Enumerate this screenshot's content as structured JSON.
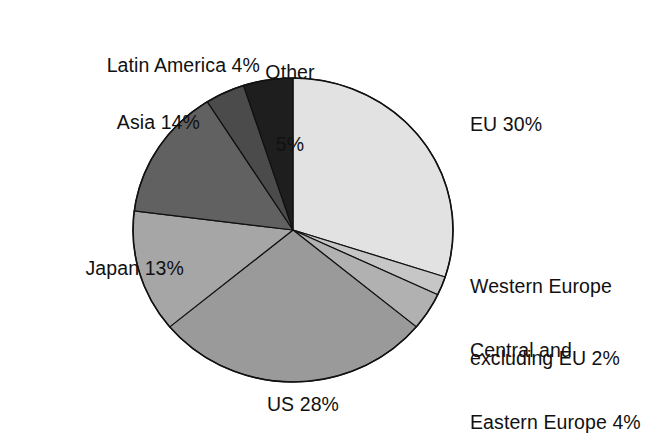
{
  "chart_data": {
    "type": "pie",
    "title": "",
    "subtitle": "",
    "xlabel": "",
    "ylabel": "",
    "legend_position": "none",
    "grid": false,
    "units": "percent",
    "start_angle_deg": 0,
    "direction": "clockwise",
    "categories": [
      "EU",
      "Western Europe excluding EU",
      "Central and Eastern Europe",
      "US",
      "Japan",
      "Asia",
      "Latin America",
      "Other"
    ],
    "values": [
      30,
      2,
      4,
      28,
      13,
      14,
      4,
      5
    ],
    "total": 100,
    "slices": [
      {
        "name": "EU",
        "value": 30,
        "label": "EU 30%",
        "color": "#e2e2e2",
        "start_deg": 0,
        "end_deg": 108
      },
      {
        "name": "Western Europe excluding EU",
        "value": 2,
        "label": "Western Europe\nexcluding EU 2%",
        "color": "#c6c6c6",
        "start_deg": 108,
        "end_deg": 115.2
      },
      {
        "name": "Central and Eastern Europe",
        "value": 4,
        "label": "Central and\nEastern Europe 4%",
        "color": "#b1b1b1",
        "start_deg": 115.2,
        "end_deg": 129.6
      },
      {
        "name": "US",
        "value": 28,
        "label": "US 28%",
        "color": "#9a9a9a",
        "start_deg": 129.6,
        "end_deg": 230.4
      },
      {
        "name": "Japan",
        "value": 13,
        "label": "Japan 13%",
        "color": "#a6a6a6",
        "start_deg": 230.4,
        "end_deg": 277.2
      },
      {
        "name": "Asia",
        "value": 14,
        "label": "Asia 14%",
        "color": "#616161",
        "start_deg": 277.2,
        "end_deg": 327.6
      },
      {
        "name": "Latin America",
        "value": 4,
        "label": "Latin America 4%",
        "color": "#4b4b4b",
        "start_deg": 327.6,
        "end_deg": 342
      },
      {
        "name": "Other",
        "value": 5,
        "label": "Other\n5%",
        "color": "#1e1e1e",
        "start_deg": 342,
        "end_deg": 360
      }
    ],
    "geometry": {
      "center_x": 293,
      "center_y": 230,
      "radius_x": 160,
      "radius_y": 152,
      "outline_color": "#111111",
      "outline_width": 1.6,
      "background": "#ffffff"
    }
  },
  "labels": {
    "eu": "EU 30%",
    "western_europe_line1": "Western Europe",
    "western_europe_line2": "excluding EU 2%",
    "central_eastern_line1": "Central and",
    "central_eastern_line2": "Eastern Europe 4%",
    "us": "US 28%",
    "japan": "Japan 13%",
    "asia": "Asia 14%",
    "latin_america": "Latin America 4%",
    "other_line1": "Other",
    "other_line2": "5%"
  }
}
